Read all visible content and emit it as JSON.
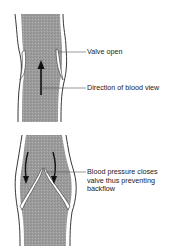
{
  "diagram": {
    "panels": [
      {
        "id": "valve-open",
        "labels": [
          {
            "text": "Valve open"
          },
          {
            "text": "Direction of blood view"
          }
        ]
      },
      {
        "id": "valve-closed",
        "labels": [
          {
            "lines": [
              "Blood pressure closes",
              "valve thus preventing",
              "backflow"
            ]
          }
        ]
      }
    ],
    "colors": {
      "vessel_fill": "#9a9a9a",
      "vessel_wall": "#ffffff",
      "outline": "#222222",
      "leader_line": "#555555"
    }
  }
}
